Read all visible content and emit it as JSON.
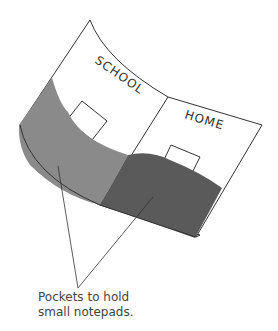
{
  "diagram": {
    "panels": [
      {
        "label": "SCHOOL",
        "side": "left"
      },
      {
        "label": "HOME",
        "side": "right"
      }
    ],
    "caption_lines": [
      "Pockets to hold",
      "small notepads."
    ],
    "colors": {
      "outline": "#333333",
      "left_pocket": "#8a8a8a",
      "right_pocket": "#5a5a5a",
      "background": "#ffffff"
    }
  }
}
